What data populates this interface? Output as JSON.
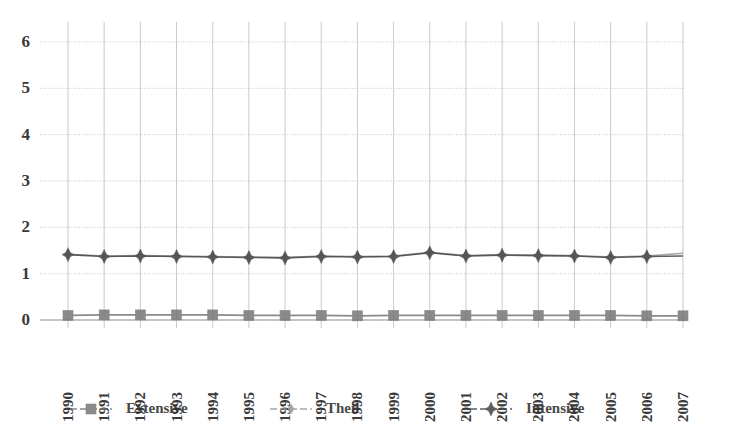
{
  "chart_data": {
    "type": "line",
    "title": "",
    "subtitle": "",
    "xlabel": "",
    "ylabel": "",
    "grid": true,
    "legend_position": "bottom",
    "xlim": [
      1990,
      2007
    ],
    "ylim": [
      0,
      6
    ],
    "ytick_values": [
      0,
      1,
      2,
      3,
      4,
      5,
      6
    ],
    "ytick_labels": [
      "0",
      "1",
      "2",
      "3",
      "4",
      "5",
      "6"
    ],
    "categories": [
      "1990",
      "1991",
      "1992",
      "1993",
      "1994",
      "1995",
      "1996",
      "1997",
      "1998",
      "1999",
      "2000",
      "2001",
      "2002",
      "2003",
      "2004",
      "2005",
      "2006",
      "2007"
    ],
    "x": [
      1990,
      1991,
      1992,
      1993,
      1994,
      1995,
      1996,
      1997,
      1998,
      1999,
      2000,
      2001,
      2002,
      2003,
      2004,
      2005,
      2006,
      2007
    ],
    "series": [
      {
        "name": "Extensive",
        "marker": "square",
        "color": "#7a7a7a",
        "values": [
          0.1,
          0.11,
          0.11,
          0.11,
          0.11,
          0.1,
          0.1,
          0.1,
          0.09,
          0.1,
          0.1,
          0.1,
          0.1,
          0.1,
          0.1,
          0.1,
          0.09,
          0.09
        ]
      },
      {
        "name": "Theil",
        "marker": "diamond",
        "color": "#9a9a9a",
        "values": [
          1.42,
          1.38,
          1.39,
          1.38,
          1.37,
          1.36,
          1.35,
          1.38,
          1.37,
          1.38,
          1.46,
          1.39,
          1.41,
          1.4,
          1.39,
          1.36,
          1.38,
          1.44
        ]
      },
      {
        "name": "Intensive",
        "marker": "star",
        "color": "#4a4a4a",
        "values": [
          1.41,
          1.37,
          1.38,
          1.37,
          1.36,
          1.35,
          1.34,
          1.37,
          1.36,
          1.37,
          1.45,
          1.38,
          1.4,
          1.39,
          1.38,
          1.35,
          1.37,
          1.38
        ]
      }
    ]
  },
  "legend": {
    "items": [
      {
        "label": "Extensive",
        "marker": "square-marker-icon"
      },
      {
        "label": "Theil",
        "marker": "diamond-marker-icon"
      },
      {
        "label": "Intensive",
        "marker": "star-marker-icon"
      }
    ]
  },
  "colors": {
    "grid": "#b9b9b9",
    "axis": "#8f8f8f",
    "extensive": "#7a7a7a",
    "theil": "#9a9a9a",
    "intensive": "#4a4a4a",
    "text": "#2f2f2f",
    "background": "#ffffff"
  }
}
